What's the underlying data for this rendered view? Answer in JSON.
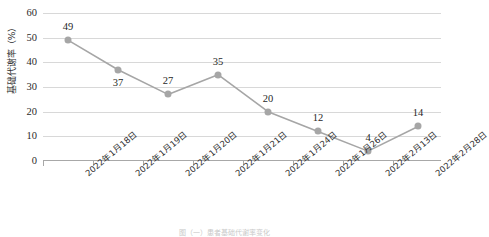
{
  "chart_data": {
    "type": "line",
    "title": "",
    "xlabel": "",
    "ylabel": "基础代谢率（%）",
    "ylim": [
      0,
      60
    ],
    "ytick_step": 10,
    "yticks": [
      "60",
      "50",
      "40",
      "30",
      "20",
      "10",
      "0"
    ],
    "grid": "horizontal",
    "legend": "none",
    "categories": [
      "2022年1月18日",
      "2022年1月19日",
      "2022年1月20日",
      "2022年1月21日",
      "2022年1月24日",
      "2022年1月26日",
      "2022年2月13日",
      "2022年2月28日"
    ],
    "values": [
      49,
      37,
      27,
      35,
      20,
      12,
      4,
      14
    ],
    "point_labels": [
      "49",
      "37",
      "27",
      "35",
      "20",
      "12",
      "4",
      "14"
    ],
    "label_positions": [
      "above",
      "below",
      "above",
      "above",
      "above",
      "above",
      "above",
      "above"
    ],
    "series_color": "#a6a6a6",
    "gridline_color": "#d8d8d8",
    "axis_color": "#a8a8a8",
    "background_color": "#ffffff",
    "text_color": "#2b2b2b"
  },
  "caption": {
    "text": "图（一）患者基础代谢率变化"
  }
}
